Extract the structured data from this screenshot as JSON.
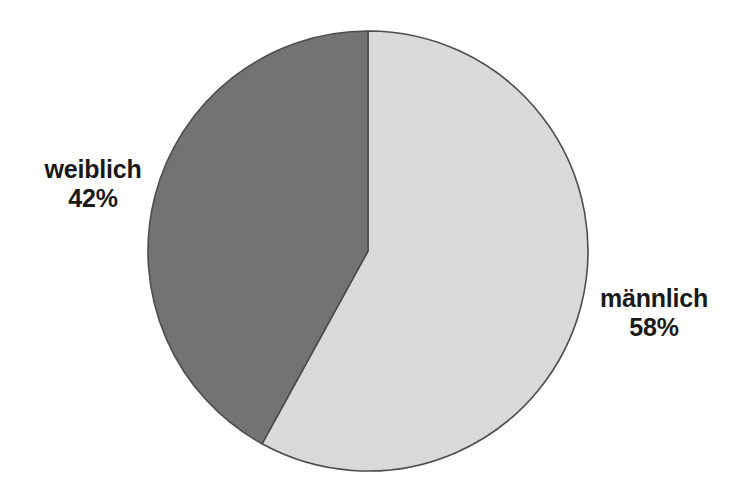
{
  "chart_data": {
    "type": "pie",
    "title": "",
    "subtitle": "",
    "xlabel": "",
    "ylabel": "",
    "legend_position": "none",
    "grid": false,
    "unit": "%",
    "categories": [
      "männlich",
      "weiblich"
    ],
    "values": [
      58,
      42
    ],
    "slices": [
      {
        "label": "männlich",
        "value": 58,
        "value_text": "58%",
        "color": "#d9d9d9",
        "start_angle_deg": 0,
        "sweep_angle_deg": 208.8,
        "label_position": "right"
      },
      {
        "label": "weiblich",
        "value": 42,
        "value_text": "42%",
        "color": "#737373",
        "start_angle_deg": 208.8,
        "sweep_angle_deg": 151.2,
        "label_position": "left"
      }
    ],
    "geometry": {
      "center_x": 368,
      "center_y": 251,
      "radius": 220,
      "start_at_twelve_oclock": true,
      "direction": "clockwise"
    },
    "colors": {
      "background": "#ffffff",
      "outline": "#4d4d4d",
      "text": "#1a1a1a",
      "slice_light": "#d9d9d9",
      "slice_dark": "#737373"
    }
  },
  "labels": {
    "left": {
      "name": "weiblich",
      "value": "42%"
    },
    "right": {
      "name": "männlich",
      "value": "58%"
    }
  }
}
